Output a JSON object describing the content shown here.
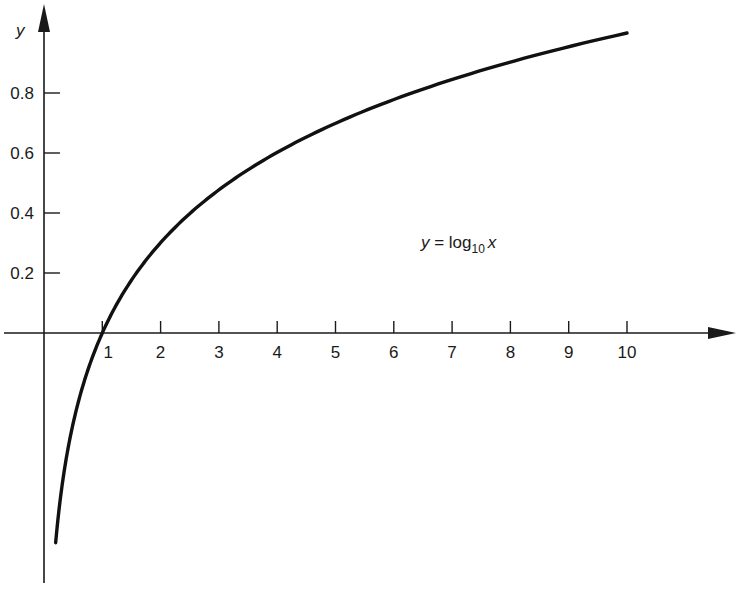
{
  "chart_data": {
    "type": "line",
    "title": "",
    "xlabel": "",
    "ylabel": "y",
    "xlim": [
      0,
      11.5
    ],
    "ylim": [
      -0.85,
      1.1
    ],
    "grid": false,
    "legend": null,
    "x_ticks": [
      1,
      2,
      3,
      4,
      5,
      6,
      7,
      8,
      9,
      10
    ],
    "x_tick_labels": [
      "1",
      "2",
      "3",
      "4",
      "5",
      "6",
      "7",
      "8",
      "9",
      "10"
    ],
    "y_ticks": [
      0.2,
      0.4,
      0.6,
      0.8
    ],
    "y_tick_labels": [
      "0.2",
      "0.4",
      "0.6",
      "0.8"
    ],
    "annotation": {
      "prefix": "y = log",
      "subscript": "10",
      "suffix": "x",
      "x": 6.5,
      "y": 0.35
    },
    "series": [
      {
        "name": "y = log10 x",
        "function": "log10(x)",
        "x": [
          0.2,
          0.3,
          0.4,
          0.5,
          0.6,
          0.8,
          1,
          1.5,
          2,
          2.5,
          3,
          4,
          5,
          6,
          7,
          8,
          9,
          10
        ],
        "y": [
          -0.699,
          -0.523,
          -0.398,
          -0.301,
          -0.222,
          -0.097,
          0,
          0.176,
          0.301,
          0.398,
          0.477,
          0.602,
          0.699,
          0.778,
          0.845,
          0.903,
          0.954,
          1.0
        ]
      }
    ]
  },
  "labels": {
    "y_axis_name": "y"
  }
}
